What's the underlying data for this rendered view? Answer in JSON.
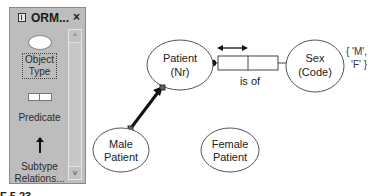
{
  "palette": {
    "title": "ORM...",
    "close_label": "×",
    "tools": [
      {
        "label_line1": "Object",
        "label_line2": "Type",
        "icon": "object-type-ellipse-icon"
      },
      {
        "label_line1": "Predicate",
        "label_line2": "",
        "icon": "predicate-boxes-icon"
      },
      {
        "label_line1": "Subtype",
        "label_line2": "Relations...",
        "icon": "subtype-arrow-icon"
      }
    ],
    "scroll_up_glyph": "^",
    "scroll_down_glyph": "v"
  },
  "diagram": {
    "entities": [
      {
        "id": "patient",
        "name": "Patient",
        "ref": "(Nr)"
      },
      {
        "id": "sex",
        "name": "Sex",
        "ref": "(Code)"
      },
      {
        "id": "male-patient",
        "name": "Male",
        "ref": "Patient"
      },
      {
        "id": "female-patient",
        "name": "Female",
        "ref": "Patient"
      }
    ],
    "fact_type": {
      "reading": "is of",
      "roles": 2
    },
    "value_constraint": {
      "line1": "{ 'M',",
      "line2": "'F' }"
    }
  },
  "caption": {
    "text": "F 5.23  ...  ..."
  }
}
